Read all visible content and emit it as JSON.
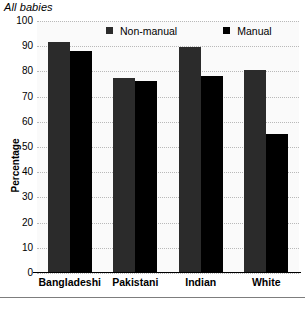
{
  "chart_data": {
    "type": "bar",
    "title": "All babies",
    "xlabel": "",
    "ylabel": "Percentage",
    "ylim": [
      0,
      100
    ],
    "yticks": [
      0,
      10,
      20,
      30,
      40,
      50,
      60,
      70,
      80,
      90,
      100
    ],
    "ytick_labels": [
      "0",
      "10",
      "20",
      "30",
      "40",
      "50",
      "60",
      "70",
      "80",
      "90",
      "100"
    ],
    "grid": true,
    "legend_position": "top-center",
    "categories": [
      "Bangladeshi",
      "Pakistani",
      "Indian",
      "White"
    ],
    "series": [
      {
        "name": "Non-manual",
        "color": "#2b2b2b",
        "values": [
          91.5,
          77.5,
          89.5,
          80.5
        ]
      },
      {
        "name": "Manual",
        "color": "#000000",
        "values": [
          88.0,
          76.0,
          78.0,
          55.0
        ]
      }
    ]
  },
  "legend": {
    "entries": [
      {
        "label": "Non-manual",
        "swatch_icon": "legend-square-icon"
      },
      {
        "label": "Manual",
        "swatch_icon": "legend-square-icon"
      }
    ]
  },
  "colors": {
    "non_manual": "#2b2b2b",
    "manual": "#000000",
    "gridline": "#b9b9b9",
    "axis": "#000000",
    "plot_background": "#fafafa"
  }
}
